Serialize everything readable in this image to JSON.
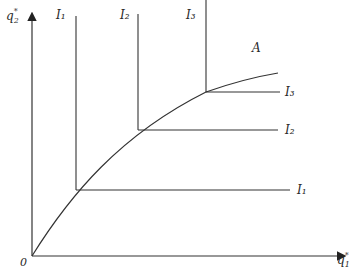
{
  "diagram": {
    "axes": {
      "x_label": "q",
      "x_sub": "1",
      "x_sup": "*",
      "y_label": "q",
      "y_sub": "2",
      "y_sup": "*",
      "origin_label": "0"
    },
    "curve_label": "A",
    "isoquants": [
      {
        "label_top": "I₁",
        "label_right": "I₁",
        "name": "I1"
      },
      {
        "label_top": "I₂",
        "label_right": "I₂",
        "name": "I2"
      },
      {
        "label_top": "I₃",
        "label_right": "I₃",
        "name": "I3"
      }
    ],
    "colors": {
      "line": "#333333",
      "background": "#ffffff"
    }
  }
}
